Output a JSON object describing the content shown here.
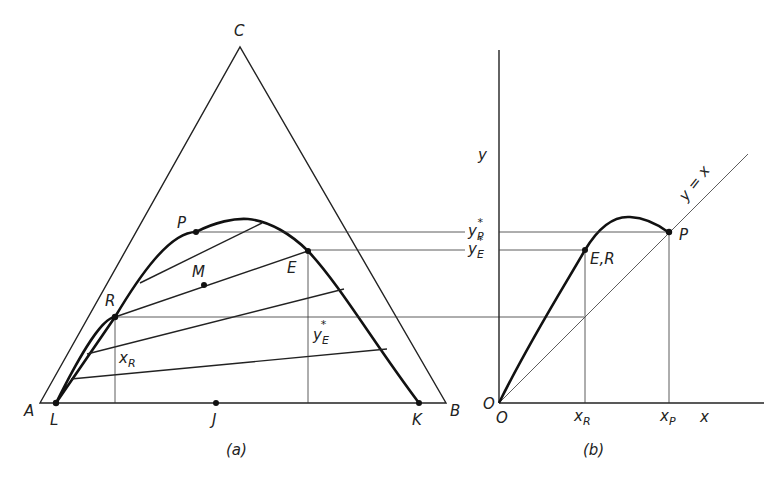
{
  "figure_a": {
    "caption": "(a)",
    "vertices": {
      "apex": "C",
      "left": "A",
      "right": "B"
    },
    "points": {
      "P": "P",
      "M": "M",
      "E": "E",
      "R": "R",
      "L": "L",
      "J": "J",
      "K": "K"
    },
    "annotations": {
      "xR": "x",
      "xR_sub": "R",
      "yE": "y",
      "yE_sub": "E",
      "yE_star": "*"
    }
  },
  "figure_b": {
    "caption": "(b)",
    "y_axis_label": "y",
    "x_axis_label": "x",
    "origin_y": "O",
    "origin_x": "O",
    "diagonal_label": "y = x",
    "point_P": "P",
    "point_ER": "E,R",
    "tick_xR": "x",
    "tick_xR_sub": "R",
    "tick_xP": "x",
    "tick_xP_sub": "P",
    "tick_yP": "y",
    "tick_yP_sub": "P",
    "tick_yP_star": "*",
    "tick_yE": "y",
    "tick_yE_sub": "E",
    "tick_yE_star": "*"
  }
}
